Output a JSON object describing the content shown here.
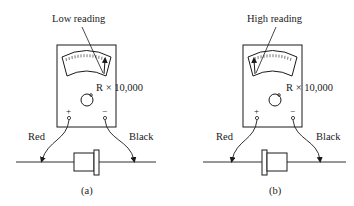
{
  "figure": {
    "panels": [
      {
        "id": "a",
        "caption": "(a)",
        "reading_label": "Low reading",
        "range_label": "R × 10,000",
        "plus_label": "+",
        "minus_label": "−",
        "left_lead_label": "Red",
        "right_lead_label": "Black",
        "needle_position": "right",
        "diode_band_side": "right"
      },
      {
        "id": "b",
        "caption": "(b)",
        "reading_label": "High reading",
        "range_label": "R × 10,000",
        "plus_label": "+",
        "minus_label": "−",
        "left_lead_label": "Red",
        "right_lead_label": "Black",
        "needle_position": "left",
        "diode_band_side": "left"
      }
    ]
  },
  "colors": {
    "ink": "#1a1a1a",
    "background": "#ffffff"
  }
}
